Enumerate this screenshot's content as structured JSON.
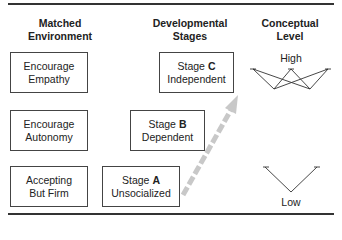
{
  "headers": {
    "environment": [
      "Matched",
      "Environment"
    ],
    "stages": [
      "Developmental",
      "Stages"
    ],
    "level": [
      "Conceptual",
      "Level"
    ]
  },
  "environments": [
    {
      "line1": "Encourage",
      "line2": "Empathy"
    },
    {
      "line1": "Encourage",
      "line2": "Autonomy"
    },
    {
      "line1": "Accepting",
      "line2": "But Firm"
    }
  ],
  "stages": [
    {
      "prefix": "Stage ",
      "letter": "C",
      "name": "Independent"
    },
    {
      "prefix": "Stage ",
      "letter": "B",
      "name": "Dependent"
    },
    {
      "prefix": "Stage ",
      "letter": "A",
      "name": "Unsocialized"
    }
  ],
  "levels": {
    "high": "High",
    "low": "Low"
  },
  "colors": {
    "arrow": "#c8c8c8",
    "border": "#444444",
    "rule": "#333333"
  }
}
